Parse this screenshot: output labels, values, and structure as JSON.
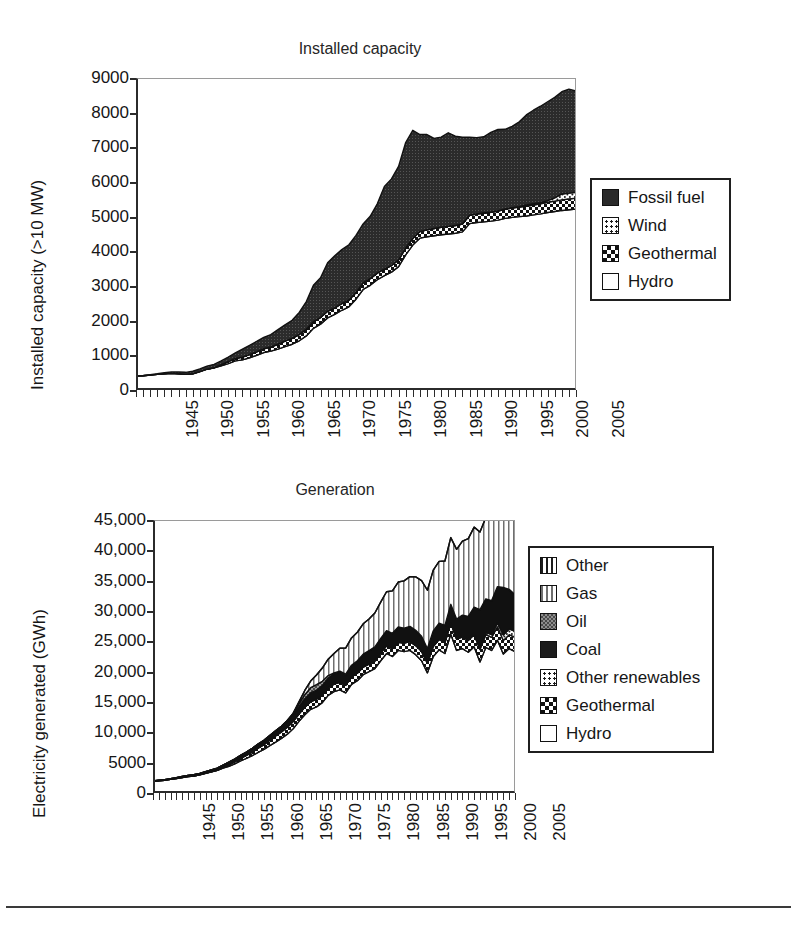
{
  "figure": {
    "background": "#ffffff",
    "footer_rule_color": "#3a3a3a"
  },
  "charts": [
    {
      "id": "installed-capacity",
      "title": "Installed capacity",
      "ylabel": "Installed capacity (>10 MW)",
      "xlabel": "",
      "ytick_labels": [
        "9000",
        "8000",
        "7000",
        "6000",
        "5000",
        "4000",
        "3000",
        "2000",
        "1000",
        "0"
      ],
      "xtick_labels": [
        "1945",
        "1950",
        "1955",
        "1960",
        "1965",
        "1970",
        "1975",
        "1980",
        "1985",
        "1990",
        "1995",
        "2000",
        "2005"
      ],
      "legend": [
        {
          "label": "Fossil fuel",
          "pattern": "p-dark"
        },
        {
          "label": "Wind",
          "pattern": "p-dots"
        },
        {
          "label": "Geothermal",
          "pattern": "p-checker-dark"
        },
        {
          "label": "Hydro",
          "pattern": "p-white"
        }
      ]
    },
    {
      "id": "generation",
      "title": "Generation",
      "ylabel": "Electricity generated (GWh)",
      "xlabel": "",
      "ytick_labels": [
        "45,000",
        "40,000",
        "35,000",
        "30,000",
        "25,000",
        "20,000",
        "15,000",
        "10,000",
        "5000",
        "0"
      ],
      "xtick_labels": [
        "1945",
        "1950",
        "1955",
        "1960",
        "1965",
        "1970",
        "1975",
        "1980",
        "1985",
        "1990",
        "1995",
        "2000",
        "2005"
      ],
      "legend": [
        {
          "label": "Other",
          "pattern": "p-vstripe-dark"
        },
        {
          "label": "Gas",
          "pattern": "p-vstripe-light"
        },
        {
          "label": "Oil",
          "pattern": "p-gray"
        },
        {
          "label": "Coal",
          "pattern": "p-solid"
        },
        {
          "label": "Other renewables",
          "pattern": "p-dots"
        },
        {
          "label": "Geothermal",
          "pattern": "p-checker-dark"
        },
        {
          "label": "Hydro",
          "pattern": "p-white"
        }
      ]
    }
  ],
  "chart_data": [
    {
      "type": "area",
      "id": "installed-capacity",
      "title": "Installed capacity",
      "xlabel": "",
      "ylabel": "Installed capacity (>10 MW)",
      "xlim": [
        1945,
        2007
      ],
      "ylim": [
        0,
        9000
      ],
      "grid": true,
      "stacked": true,
      "legend_position": "right",
      "x": [
        1945,
        1946,
        1947,
        1948,
        1949,
        1950,
        1951,
        1952,
        1953,
        1954,
        1955,
        1956,
        1957,
        1958,
        1959,
        1960,
        1961,
        1962,
        1963,
        1964,
        1965,
        1966,
        1967,
        1968,
        1969,
        1970,
        1971,
        1972,
        1973,
        1974,
        1975,
        1976,
        1977,
        1978,
        1979,
        1980,
        1981,
        1982,
        1983,
        1984,
        1985,
        1986,
        1987,
        1988,
        1989,
        1990,
        1991,
        1992,
        1993,
        1994,
        1995,
        1996,
        1997,
        1998,
        1999,
        2000,
        2001,
        2002,
        2003,
        2004,
        2005,
        2006,
        2007
      ],
      "series": [
        {
          "name": "Hydro",
          "pattern": "white",
          "values": [
            400,
            410,
            430,
            450,
            470,
            480,
            470,
            450,
            470,
            530,
            600,
            640,
            700,
            760,
            840,
            870,
            930,
            1000,
            1080,
            1120,
            1180,
            1250,
            1320,
            1420,
            1560,
            1780,
            1900,
            2080,
            2180,
            2300,
            2400,
            2620,
            2900,
            3020,
            3180,
            3300,
            3400,
            3560,
            3900,
            4180,
            4380,
            4420,
            4450,
            4480,
            4500,
            4520,
            4560,
            4800,
            4830,
            4850,
            4870,
            4900,
            4950,
            4980,
            5000,
            5020,
            5050,
            5080,
            5120,
            5150,
            5180,
            5200,
            5220
          ]
        },
        {
          "name": "Geothermal",
          "pattern": "checker-dark",
          "values": [
            0,
            0,
            0,
            0,
            0,
            0,
            0,
            0,
            0,
            0,
            0,
            0,
            30,
            60,
            70,
            80,
            90,
            100,
            110,
            120,
            140,
            160,
            170,
            180,
            190,
            190,
            190,
            190,
            190,
            190,
            190,
            190,
            190,
            190,
            190,
            190,
            190,
            190,
            190,
            190,
            190,
            200,
            210,
            215,
            220,
            225,
            230,
            240,
            245,
            250,
            255,
            260,
            265,
            270,
            275,
            280,
            285,
            290,
            295,
            300,
            305,
            310,
            315
          ]
        },
        {
          "name": "Wind",
          "pattern": "dots",
          "values": [
            0,
            0,
            0,
            0,
            0,
            0,
            0,
            0,
            0,
            0,
            0,
            0,
            0,
            0,
            0,
            0,
            0,
            0,
            0,
            0,
            0,
            0,
            0,
            0,
            0,
            0,
            0,
            0,
            0,
            0,
            0,
            0,
            0,
            0,
            0,
            0,
            0,
            0,
            0,
            0,
            0,
            0,
            0,
            0,
            0,
            0,
            0,
            0,
            4,
            4,
            4,
            5,
            5,
            6,
            10,
            36,
            36,
            36,
            50,
            90,
            170,
            170,
            170
          ]
        },
        {
          "name": "Fossil fuel",
          "pattern": "dark",
          "values": [
            10,
            10,
            15,
            20,
            30,
            40,
            50,
            60,
            70,
            80,
            90,
            100,
            110,
            130,
            160,
            230,
            270,
            300,
            330,
            360,
            420,
            470,
            520,
            640,
            800,
            1050,
            1150,
            1400,
            1500,
            1560,
            1600,
            1650,
            1700,
            1800,
            2000,
            2380,
            2500,
            2700,
            3050,
            3120,
            2800,
            2750,
            2600,
            2600,
            2700,
            2580,
            2500,
            2250,
            2200,
            2200,
            2300,
            2350,
            2300,
            2350,
            2450,
            2600,
            2700,
            2780,
            2850,
            2900,
            2950,
            3000,
            2920
          ]
        }
      ]
    },
    {
      "type": "area",
      "id": "generation",
      "title": "Generation",
      "xlabel": "",
      "ylabel": "Electricity generated (GWh)",
      "xlim": [
        1945,
        2007
      ],
      "ylim": [
        0,
        45000
      ],
      "grid": true,
      "stacked": true,
      "legend_position": "right",
      "x": [
        1945,
        1946,
        1947,
        1948,
        1949,
        1950,
        1951,
        1952,
        1953,
        1954,
        1955,
        1956,
        1957,
        1958,
        1959,
        1960,
        1961,
        1962,
        1963,
        1964,
        1965,
        1966,
        1967,
        1968,
        1969,
        1970,
        1971,
        1972,
        1973,
        1974,
        1975,
        1976,
        1977,
        1978,
        1979,
        1980,
        1981,
        1982,
        1983,
        1984,
        1985,
        1986,
        1987,
        1988,
        1989,
        1990,
        1991,
        1992,
        1993,
        1994,
        1995,
        1996,
        1997,
        1998,
        1999,
        2000,
        2001,
        2002,
        2003,
        2004,
        2005,
        2006,
        2007
      ],
      "series": [
        {
          "name": "Hydro",
          "pattern": "white",
          "values": [
            1900,
            2000,
            2100,
            2250,
            2400,
            2550,
            2700,
            2800,
            3000,
            3250,
            3500,
            3750,
            4100,
            4400,
            4800,
            5300,
            5700,
            6150,
            6700,
            7200,
            7800,
            8400,
            9000,
            9700,
            10600,
            11800,
            12900,
            13800,
            14200,
            14900,
            16100,
            16700,
            17000,
            16500,
            17900,
            18500,
            19500,
            20000,
            20500,
            21800,
            23000,
            22500,
            23500,
            23300,
            23500,
            22800,
            21800,
            19800,
            22500,
            23600,
            23000,
            26200,
            23500,
            23800,
            23200,
            24100,
            21600,
            24000,
            23500,
            25200,
            22900,
            23800,
            23300
          ]
        },
        {
          "name": "Geothermal",
          "pattern": "checker-dark",
          "values": [
            0,
            0,
            0,
            0,
            0,
            0,
            0,
            0,
            0,
            0,
            0,
            0,
            100,
            250,
            330,
            400,
            500,
            600,
            700,
            780,
            900,
            1000,
            1080,
            1150,
            1180,
            1200,
            1250,
            1250,
            1250,
            1250,
            1250,
            1250,
            1250,
            1250,
            1250,
            1250,
            1250,
            1250,
            1250,
            1250,
            1250,
            1300,
            1350,
            1400,
            1450,
            1500,
            1550,
            1600,
            1650,
            1700,
            1750,
            1800,
            1850,
            1900,
            1950,
            2000,
            2050,
            2100,
            2150,
            2200,
            2250,
            2300,
            2350
          ]
        },
        {
          "name": "Other renewables",
          "pattern": "dots",
          "values": [
            0,
            0,
            0,
            0,
            0,
            0,
            0,
            0,
            0,
            0,
            0,
            0,
            0,
            0,
            0,
            0,
            0,
            0,
            0,
            0,
            0,
            0,
            0,
            0,
            0,
            0,
            0,
            0,
            0,
            0,
            0,
            0,
            0,
            0,
            0,
            0,
            0,
            0,
            0,
            0,
            0,
            0,
            0,
            0,
            0,
            0,
            0,
            0,
            60,
            60,
            70,
            80,
            90,
            100,
            150,
            300,
            350,
            380,
            450,
            600,
            900,
            950,
            1000
          ]
        },
        {
          "name": "Coal",
          "pattern": "solid",
          "values": [
            80,
            90,
            100,
            110,
            130,
            160,
            180,
            200,
            230,
            260,
            300,
            340,
            380,
            420,
            460,
            520,
            560,
            600,
            650,
            700,
            780,
            850,
            920,
            1000,
            1100,
            1250,
            1350,
            1450,
            1500,
            1550,
            1600,
            1650,
            1700,
            1750,
            1850,
            2000,
            2100,
            2200,
            2300,
            2400,
            2500,
            2500,
            2500,
            2450,
            2500,
            2500,
            2450,
            2400,
            2500,
            2600,
            2800,
            3000,
            3200,
            3500,
            3800,
            4200,
            6200,
            5500,
            5600,
            6000,
            7800,
            6500,
            6000
          ]
        },
        {
          "name": "Oil",
          "pattern": "gray",
          "values": [
            0,
            0,
            0,
            0,
            0,
            0,
            0,
            0,
            0,
            0,
            0,
            0,
            0,
            0,
            0,
            0,
            0,
            0,
            0,
            0,
            0,
            0,
            0,
            100,
            250,
            500,
            700,
            850,
            900,
            700,
            400,
            200,
            120,
            80,
            60,
            50,
            40,
            30,
            25,
            20,
            20,
            20,
            20,
            20,
            20,
            20,
            20,
            20,
            20,
            20,
            20,
            20,
            20,
            20,
            20,
            20,
            20,
            20,
            20,
            20,
            20,
            20,
            20
          ]
        },
        {
          "name": "Gas",
          "pattern": "vstripe-light",
          "values": [
            0,
            0,
            0,
            0,
            0,
            0,
            0,
            0,
            0,
            0,
            0,
            0,
            0,
            0,
            0,
            0,
            0,
            0,
            0,
            0,
            0,
            0,
            0,
            0,
            0,
            300,
            700,
            1100,
            1600,
            2200,
            2700,
            3200,
            3800,
            4300,
            4500,
            4700,
            5000,
            5200,
            5600,
            6000,
            6400,
            7000,
            7400,
            7800,
            8200,
            8800,
            9200,
            9600,
            10000,
            10200,
            10600,
            11000,
            11500,
            12200,
            12800,
            13200,
            12800,
            13400,
            14000,
            14200,
            14500,
            15200,
            15800
          ]
        },
        {
          "name": "Other",
          "pattern": "vstripe-dark",
          "values": [
            0,
            0,
            0,
            0,
            0,
            0,
            0,
            0,
            0,
            0,
            0,
            0,
            0,
            0,
            0,
            0,
            0,
            0,
            0,
            0,
            0,
            0,
            0,
            0,
            0,
            0,
            0,
            0,
            0,
            0,
            0,
            0,
            0,
            0,
            0,
            0,
            0,
            0,
            0,
            0,
            0,
            0,
            0,
            0,
            0,
            0,
            0,
            0,
            0,
            0,
            0,
            0,
            0,
            0,
            0,
            0,
            0,
            0,
            0,
            0,
            0,
            0,
            0
          ]
        }
      ]
    }
  ]
}
